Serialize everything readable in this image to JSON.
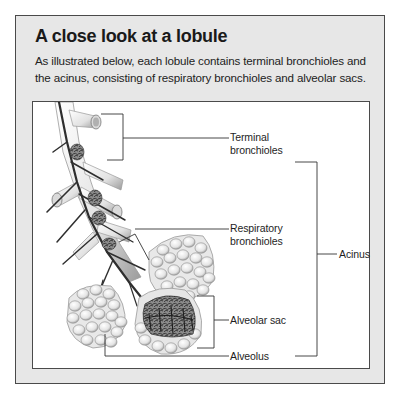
{
  "header": {
    "title": "A close look at a lobule",
    "description": "As illustrated below, each lobule contains terminal bronchioles and the acinus, consisting of respiratory bronchioles and alveolar sacs."
  },
  "diagram": {
    "labels": {
      "terminal_bronchioles": [
        "Terminal",
        "bronchioles"
      ],
      "respiratory_bronchioles": [
        "Respiratory",
        "bronchioles"
      ],
      "alveolar_sac": "Alveolar sac",
      "alveolus": "Alveolus",
      "acinus": "Acinus"
    },
    "colors": {
      "panel_bg": "#e7e7e7",
      "figure_bg": "#ffffff",
      "border": "#4a4a4a",
      "leader_line": "#333333"
    }
  }
}
